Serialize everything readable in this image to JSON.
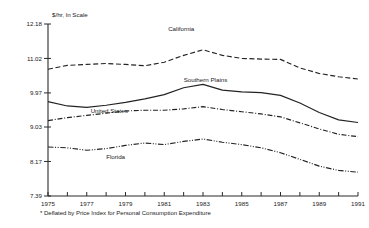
{
  "chart_data": {
    "type": "line",
    "title": "",
    "subtitle": "",
    "unit_label": "$/hr, ln Scale",
    "xlabel": "",
    "ylabel": "",
    "footnote": "* Deflated by Price Index for Personal Consumption Expenditure",
    "grid": false,
    "legend_position": "inline-labels",
    "log_scale": true,
    "x": [
      1975,
      1976,
      1977,
      1978,
      1979,
      1980,
      1981,
      1982,
      1983,
      1984,
      1985,
      1986,
      1987,
      1988,
      1989,
      1990,
      1991
    ],
    "xtick_labels": [
      "1975",
      "1977",
      "1979",
      "1981",
      "1983",
      "1985",
      "1987",
      "1989",
      "1991"
    ],
    "xtick_values": [
      1975,
      1977,
      1979,
      1981,
      1983,
      1985,
      1987,
      1989,
      1991
    ],
    "xlim": [
      1975,
      1991
    ],
    "ytick_labels": [
      "12.18",
      "11.02",
      "9.97",
      "9.03",
      "8.17",
      "7.39"
    ],
    "ytick_values": [
      12.18,
      11.02,
      9.97,
      9.03,
      8.17,
      7.39
    ],
    "ylim": [
      7.39,
      12.18
    ],
    "series": [
      {
        "name": "California",
        "style": "dashed",
        "label_x": 1981.2,
        "label_y": 11.95,
        "values": [
          10.68,
          10.8,
          10.83,
          10.86,
          10.83,
          10.79,
          10.9,
          11.12,
          11.3,
          11.12,
          11.02,
          11.0,
          10.99,
          10.72,
          10.55,
          10.45,
          10.38
        ]
      },
      {
        "name": "Southern Plains",
        "style": "solid",
        "label_x": 1982.0,
        "label_y": 10.3,
        "values": [
          9.72,
          9.6,
          9.56,
          9.62,
          9.7,
          9.8,
          9.92,
          10.12,
          10.22,
          10.05,
          10.0,
          9.98,
          9.9,
          9.68,
          9.42,
          9.22,
          9.15
        ]
      },
      {
        "name": "United States",
        "style": "dashdot",
        "label_x": 1977.2,
        "label_y": 9.4,
        "values": [
          9.2,
          9.28,
          9.34,
          9.4,
          9.46,
          9.48,
          9.48,
          9.52,
          9.58,
          9.5,
          9.44,
          9.38,
          9.3,
          9.14,
          8.98,
          8.84,
          8.78
        ]
      },
      {
        "name": "Florida",
        "style": "dashdotdot",
        "label_x": 1978.0,
        "label_y": 8.22,
        "values": [
          8.52,
          8.5,
          8.44,
          8.48,
          8.56,
          8.62,
          8.58,
          8.66,
          8.72,
          8.64,
          8.58,
          8.5,
          8.38,
          8.22,
          8.06,
          7.96,
          7.92
        ]
      }
    ]
  }
}
